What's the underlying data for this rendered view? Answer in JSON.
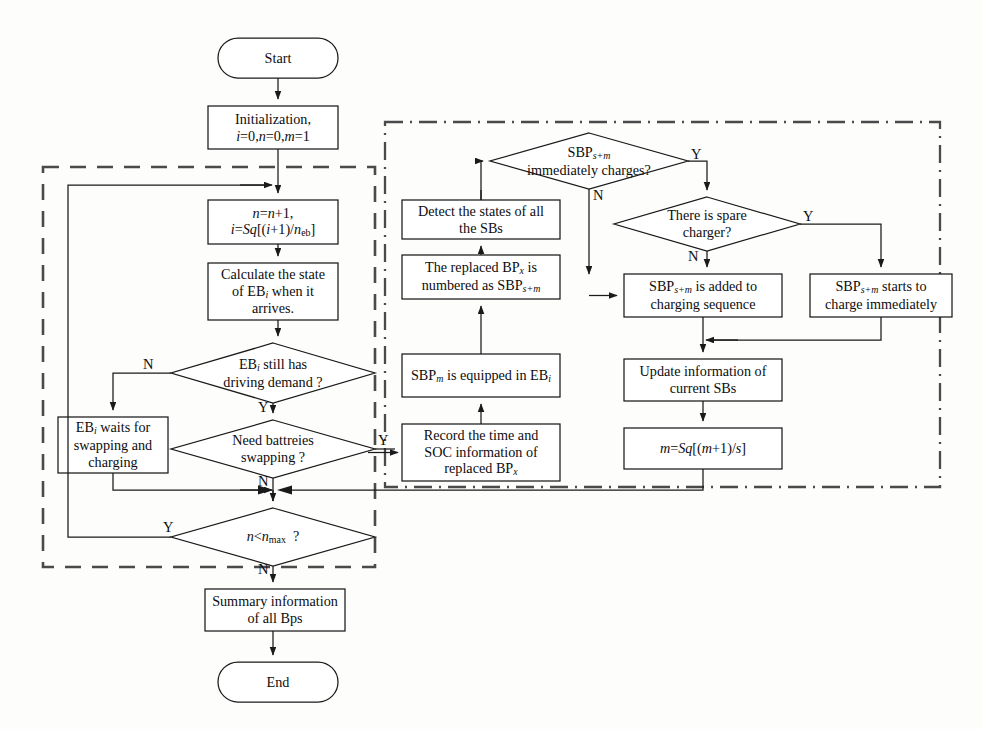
{
  "diagram": {
    "stroke_color": "#1a1a1a",
    "dashed_group_color": "#4a4a4a",
    "background": "#fdfdfc"
  },
  "nodes": {
    "start": {
      "label": "Start",
      "shape": "terminator"
    },
    "initialization": {
      "line1": "Initialization,",
      "line2_html": "<span class='it'>i</span>=0,<span class='it'>n</span>=0,<span class='it'>m</span>=1",
      "shape": "process"
    },
    "increment": {
      "line1_html": "<span class='it'>n</span>=<span class='it'>n</span>+1,",
      "line2_html": "<span class='it'>i</span>=<span class='it'>Sq</span>[(<span class='it'>i</span>+1)/<span class='it'>n</span><sub>eb</sub>]",
      "shape": "process"
    },
    "calculate_state": {
      "line1": "Calculate the state",
      "line2_html": "of EB<sub class='it'>i</sub> when it",
      "line3": "arrives.",
      "shape": "process"
    },
    "driving_demand": {
      "line1_html": "EB<sub class='it'>i</sub> still has",
      "line2": "driving demand ?",
      "shape": "decision"
    },
    "waits": {
      "line1_html": "EB<sub class='it'>i</sub> waits for",
      "line2": "swapping and",
      "line3": "charging",
      "shape": "process"
    },
    "need_swapping": {
      "line1": "Need battreies",
      "line2": "swapping ?",
      "shape": "decision"
    },
    "n_less_nmax": {
      "label_html": "<span class='it'>n</span>&lt;<span class='it'>n</span><sub>max</sub>&nbsp; ?",
      "shape": "decision"
    },
    "summary": {
      "line1": "Summary information",
      "line2": "of all Bps",
      "shape": "process"
    },
    "end": {
      "label": "End",
      "shape": "terminator"
    },
    "record_time": {
      "line1": "Record the time and",
      "line2": "SOC information of",
      "line3_html": "replaced BP<sub class='it'>x</sub>",
      "shape": "process"
    },
    "sbp_equipped": {
      "label_html": "SBP<sub class='it'>m</sub> is equipped in EB<sub class='it'>i</sub>",
      "shape": "process"
    },
    "replaced_numbered": {
      "line1_html": "The replaced BP<sub class='it'>x</sub> is",
      "line2_html": "numbered as SBP<sub class='it'>s+m</sub>",
      "shape": "process"
    },
    "detect_states": {
      "line1": "Detect the states of  all",
      "line2": "the SBs",
      "shape": "process"
    },
    "immediately_charges": {
      "line1_html": "SBP<sub class='it'>s+m</sub>",
      "line2": "immediately charges?",
      "shape": "decision"
    },
    "spare_charger": {
      "line1": "There is spare",
      "line2": "charger?",
      "shape": "decision"
    },
    "added_to_queue": {
      "line1_html": "SBP<sub class='it'>s+m</sub> is added to",
      "line2": "charging sequence",
      "shape": "process"
    },
    "charge_immediately": {
      "line1_html": "SBP<sub class='it'>s+m</sub> starts to",
      "line2": "charge immediately",
      "shape": "process"
    },
    "update_info": {
      "line1": "Update information of",
      "line2": "current SBs",
      "shape": "process"
    },
    "m_update": {
      "label_html": "<span class='it'>m</span>=<span class='it'>Sq</span>[(<span class='it'>m</span>+1)/<span class='it'>s</span>]",
      "shape": "process"
    }
  },
  "edge_labels": {
    "driving_demand_no": "N",
    "driving_demand_yes": "Y",
    "need_swapping_yes": "Y",
    "need_swapping_no": "N",
    "n_less_nmax_yes": "Y",
    "n_less_nmax_no": "N",
    "immediately_charges_yes": "Y",
    "immediately_charges_no": "N",
    "spare_charger_yes": "Y",
    "spare_charger_no": "N"
  },
  "groups": {
    "left_dashed": {
      "style": "dashed",
      "note": "EB driving / swapping loop"
    },
    "right_dashdot": {
      "style": "dash-dot",
      "note": "SBP charging management"
    }
  }
}
